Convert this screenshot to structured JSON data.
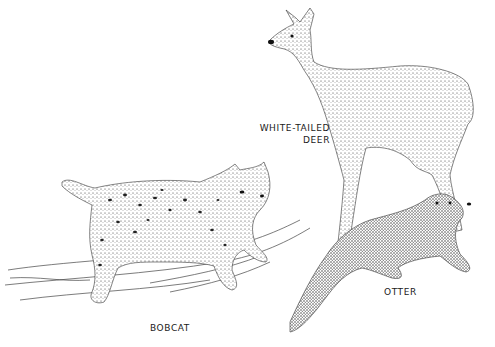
{
  "illustration": {
    "style": "stippled pen-and-ink drawing",
    "background": "#ffffff",
    "ink": "#1a1a1a"
  },
  "animals": [
    {
      "name": "bobcat",
      "label": "BOBCAT"
    },
    {
      "name": "white-tailed-deer",
      "label_line1": "WHITE-TAILED",
      "label_line2": "DEER"
    },
    {
      "name": "otter",
      "label": "OTTER"
    }
  ]
}
